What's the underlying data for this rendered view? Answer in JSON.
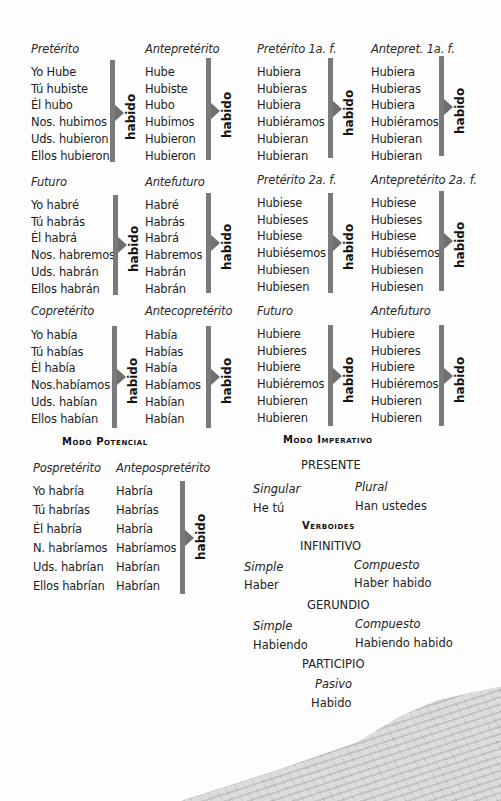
{
  "participle_label": "habido",
  "indicative": {
    "blocks": [
      {
        "simple": {
          "tense": "Pretérito",
          "forms": [
            "Yo Hube",
            "Tú hubiste",
            "Él hubo",
            "Nos. hubimos",
            "Uds. hubieron",
            "Ellos hubieron"
          ]
        },
        "compound": {
          "tense": "Antepretérito",
          "forms": [
            "Hube",
            "Hubiste",
            "Hubo",
            "Hubimos",
            "Hubieron",
            "Hubieron"
          ]
        }
      },
      {
        "simple": {
          "tense": "Futuro",
          "forms": [
            "Yo habré",
            "Tú habrás",
            "Él habrá",
            "Nos. habremos",
            "Uds. habrán",
            "Ellos habrán"
          ]
        },
        "compound": {
          "tense": "Antefuturo",
          "forms": [
            "Habré",
            "Habrás",
            "Habrá",
            "Habremos",
            "Habrán",
            "Habrán"
          ]
        }
      },
      {
        "simple": {
          "tense": "Copretérito",
          "forms": [
            "Yo había",
            "Tú habías",
            "Él había",
            "Nos.habíamos",
            "Uds. habían",
            "Ellos habían"
          ]
        },
        "compound": {
          "tense": "Antecopretérito",
          "forms": [
            "Había",
            "Habías",
            "Había",
            "Habíamos",
            "Habían",
            "Habían"
          ]
        }
      }
    ]
  },
  "subjunctive": {
    "blocks": [
      {
        "simple": {
          "tense": "Pretérito 1a. f.",
          "forms": [
            "Hubiera",
            "Hubieras",
            "Hubiera",
            "Hubiéramos",
            "Hubieran",
            "Hubieran"
          ]
        },
        "compound": {
          "tense": "Antepret. 1a. f.",
          "forms": [
            "Hubiera",
            "Hubieras",
            "Hubiera",
            "Hubiéramos",
            "Hubieran",
            "Hubieran"
          ]
        }
      },
      {
        "simple": {
          "tense": "Pretérito 2a. f.",
          "forms": [
            "Hubiese",
            "Hubieses",
            "Hubiese",
            "Hubiésemos",
            "Hubiesen",
            "Hubiesen"
          ]
        },
        "compound": {
          "tense": "Antepretérito 2a. f.",
          "forms": [
            "Hubiese",
            "Hubieses",
            "Hubiese",
            "Hubiésemos",
            "Hubiesen",
            "Hubiesen"
          ]
        }
      },
      {
        "simple": {
          "tense": "Futuro",
          "forms": [
            "Hubiere",
            "Hubieres",
            "Hubiere",
            "Hubiéremos",
            "Hubieren",
            "Hubieren"
          ]
        },
        "compound": {
          "tense": "Antefuturo",
          "forms": [
            "Hubiere",
            "Hubieres",
            "Hubiere",
            "Hubiéremos",
            "Hubieren",
            "Hubieren"
          ]
        }
      }
    ]
  },
  "potential": {
    "title": "Modo Potencial",
    "simple": {
      "tense": "Pospretérito",
      "forms": [
        "Yo habría",
        "Tú habrías",
        "Él habría",
        "N. habríamos",
        "Uds. habrían",
        "Ellos habrían"
      ]
    },
    "compound": {
      "tense": "Antepospretérito",
      "forms": [
        "Habría",
        "Habrías",
        "Habría",
        "Habríamos",
        "Habrían",
        "Habrían"
      ]
    }
  },
  "imperative": {
    "title": "Modo Imperativo",
    "present_label": "PRESENTE",
    "singular_label": "Singular",
    "plural_label": "Plural",
    "singular_form": "He tú",
    "plural_form": "Han ustedes"
  },
  "verboids": {
    "title": "Verboides",
    "infinitive": {
      "label": "INFINITIVO",
      "simple_label": "Simple",
      "compound_label": "Compuesto",
      "simple": "Haber",
      "compound": "Haber habido"
    },
    "gerund": {
      "label": "GERUNDIO",
      "simple_label": "Simple",
      "compound_label": "Compuesto",
      "simple": "Habiendo",
      "compound": "Habiendo habido"
    },
    "participle": {
      "label": "PARTICIPIO",
      "passive_label": "Pasivo",
      "value": "Habido"
    }
  },
  "colors": {
    "bracket": "#7a7a7a",
    "text": "#1e1e1e"
  }
}
